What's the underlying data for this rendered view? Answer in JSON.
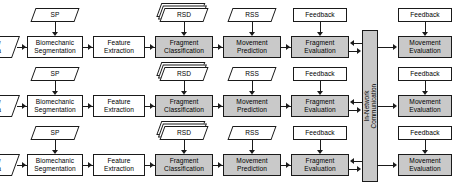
{
  "diagram": {
    "colors": {
      "shaded_fill": "#c9c9c9",
      "plain_fill": "#ffffff",
      "stroke": "#1a1a1a"
    },
    "hub": {
      "label": "In-Network\nCommunication",
      "shaded": true
    },
    "columns": [
      {
        "key": "raw_data",
        "label": "Raw\nData",
        "type": "parallelogram",
        "shaded": false
      },
      {
        "key": "biomechanic_segmentation",
        "label": "Biomechanic\nSegmentation",
        "type": "box",
        "shaded": false
      },
      {
        "key": "feature_extraction",
        "label": "Feature\nExtraction",
        "type": "box",
        "shaded": false
      },
      {
        "key": "fragment_classification",
        "label": "Fragment\nClassification",
        "type": "box",
        "shaded": true
      },
      {
        "key": "movement_prediction",
        "label": "Movement\nPrediction",
        "type": "box",
        "shaded": true
      },
      {
        "key": "fragment_evaluation",
        "label": "Fragment\nEvaluation",
        "type": "box",
        "shaded": true
      },
      {
        "key": "movement_evaluation",
        "label": "Movement\nEvaluation",
        "type": "box",
        "shaded": true
      }
    ],
    "inputs": [
      {
        "key": "sp",
        "label": "SP",
        "type": "parallelogram",
        "target": "biomechanic_segmentation"
      },
      {
        "key": "rsd",
        "label": "RSD",
        "type": "parallelogram-stacked",
        "target": "fragment_classification"
      },
      {
        "key": "rss",
        "label": "RSS",
        "type": "parallelogram",
        "target": "movement_prediction"
      }
    ],
    "feedback": [
      {
        "key": "feedback_fragment",
        "label": "Feedback",
        "target": "fragment_evaluation"
      },
      {
        "key": "feedback_movement",
        "label": "Feedback",
        "target": "movement_evaluation"
      }
    ],
    "rows": [
      {
        "key": "row-1",
        "index": 1
      },
      {
        "key": "row-2",
        "index": 2
      },
      {
        "key": "row-3",
        "index": 3
      }
    ]
  }
}
